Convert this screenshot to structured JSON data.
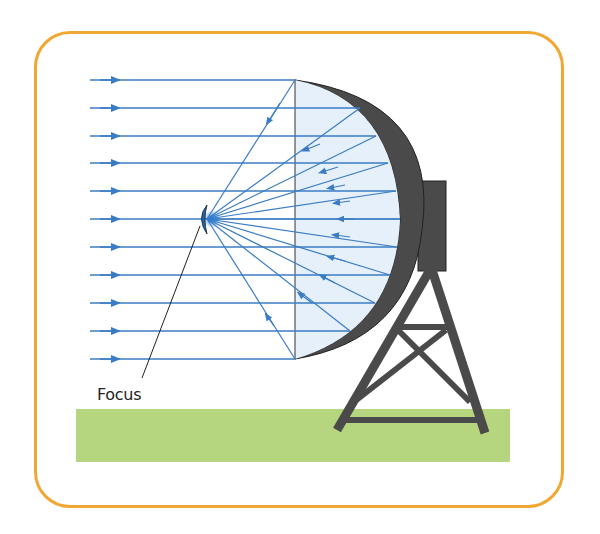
{
  "diagram": {
    "labels": {
      "focus": "Focus"
    },
    "colors": {
      "frame": "#f0a733",
      "ray": "#3a7cc4",
      "dish_fill": "#e6f0fa",
      "dish_shell": "#4a4a4a",
      "ground": "#b5d57e",
      "focus_receiver": "#2466a8"
    },
    "incoming_ray_count": 11,
    "elements": [
      "incoming-parallel-rays",
      "parabolic-dish",
      "reflected-rays",
      "focus-receiver",
      "support-tower",
      "ground"
    ]
  }
}
